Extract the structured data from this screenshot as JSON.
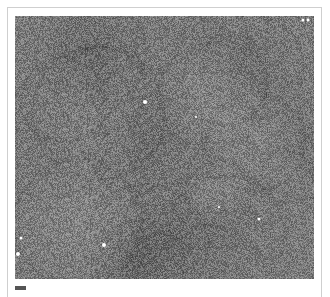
{
  "figure": {
    "type": "grayscale micrograph",
    "image": {
      "base_gray": "#7a7a7a",
      "noise_amplitude": 70,
      "bright_spots": [
        {
          "x": 145,
          "y": 102,
          "r": 2
        },
        {
          "x": 196,
          "y": 117,
          "r": 1
        },
        {
          "x": 104,
          "y": 245,
          "r": 2
        },
        {
          "x": 21,
          "y": 238,
          "r": 1.5
        },
        {
          "x": 18,
          "y": 254,
          "r": 2
        },
        {
          "x": 259,
          "y": 219,
          "r": 1.5
        },
        {
          "x": 219,
          "y": 207,
          "r": 1
        },
        {
          "x": 303,
          "y": 20,
          "r": 1.5
        },
        {
          "x": 308,
          "y": 20,
          "r": 1.5
        }
      ]
    },
    "scale_bar": {
      "color": "#555555",
      "label": ""
    }
  }
}
